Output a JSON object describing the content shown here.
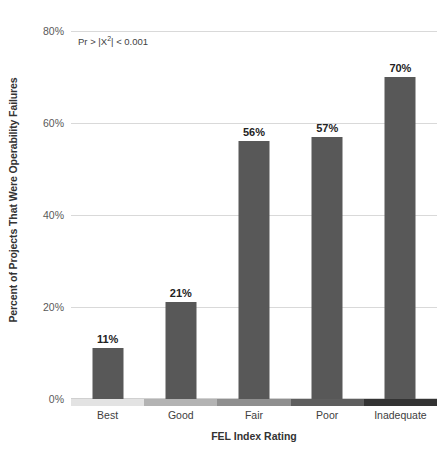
{
  "chart_data": {
    "type": "bar",
    "title": "",
    "xlabel": "FEL Index Rating",
    "ylabel": "Percent of Projects That Were Operability Failures",
    "categories": [
      "Best",
      "Good",
      "Fair",
      "Poor",
      "Inadequate"
    ],
    "values": [
      11,
      21,
      56,
      57,
      70
    ],
    "value_labels": [
      "11%",
      "21%",
      "56%",
      "57%",
      "70%"
    ],
    "ylim": [
      0,
      80
    ],
    "ytick_values": [
      0,
      20,
      40,
      60,
      80
    ],
    "ytick_labels": [
      "0%",
      "20%",
      "40%",
      "60%",
      "80%"
    ],
    "grid": true,
    "legend": "none",
    "annotations": [
      {
        "text_prefix": "Pr > |X",
        "text_sup": "2",
        "text_suffix": "| < 0.001"
      }
    ],
    "bar_color": "#585858",
    "gridline_color": "#d9d9d9",
    "axis_band_colors": [
      "#e3e3e3",
      "#b3b3b3",
      "#8f8f8f",
      "#5e5e5e",
      "#333333"
    ]
  }
}
